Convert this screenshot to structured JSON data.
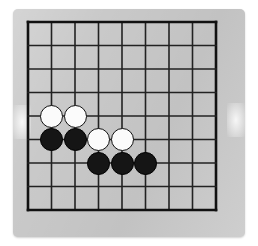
{
  "scene": {
    "kind": "go-board-photo",
    "page_background": "#ffffff",
    "board_background": "#c9c9c9",
    "line_color": "#222222",
    "border_color": "#111111"
  },
  "board": {
    "name": "go-board",
    "size_label": "9x9",
    "columns": 9,
    "rows": 9,
    "cell_size": 23.5,
    "origin_x": 15,
    "origin_y": 13,
    "line_width": 1.6,
    "border_width": 2.6
  },
  "stones": {
    "black_color": "#151515",
    "white_color": "#fbfbfb",
    "radius": 11.5,
    "items": [
      {
        "name": "white-stone-b5",
        "color": "white",
        "col": 1,
        "row": 4
      },
      {
        "name": "white-stone-c5",
        "color": "white",
        "col": 2,
        "row": 4
      },
      {
        "name": "black-stone-b4",
        "color": "black",
        "col": 1,
        "row": 5
      },
      {
        "name": "black-stone-c4",
        "color": "black",
        "col": 2,
        "row": 5
      },
      {
        "name": "white-stone-d4",
        "color": "white",
        "col": 3,
        "row": 5
      },
      {
        "name": "white-stone-e4",
        "color": "white",
        "col": 4,
        "row": 5
      },
      {
        "name": "black-stone-d3",
        "color": "black",
        "col": 3,
        "row": 6
      },
      {
        "name": "black-stone-e3",
        "color": "black",
        "col": 4,
        "row": 6
      },
      {
        "name": "black-stone-f3",
        "color": "black",
        "col": 5,
        "row": 6
      }
    ]
  }
}
